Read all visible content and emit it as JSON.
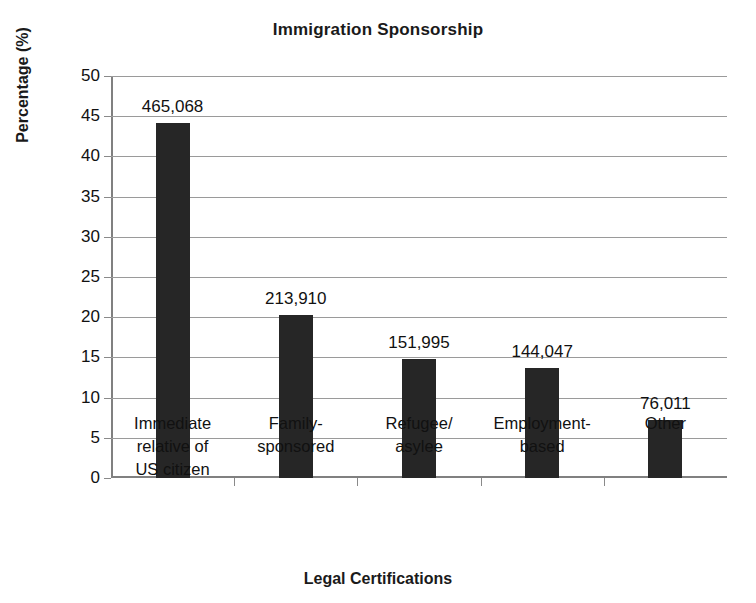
{
  "chart_data": {
    "type": "bar",
    "title": "Immigration Sponsorship",
    "xlabel": "Legal Certifications",
    "ylabel": "Percentage (%)",
    "ylim": [
      0,
      50
    ],
    "ytick_step": 5,
    "yticks": [
      "50",
      "45",
      "40",
      "35",
      "30",
      "25",
      "20",
      "15",
      "10",
      "5",
      "0"
    ],
    "grid": true,
    "legend": "none",
    "bar_color": "#262626",
    "categories": [
      "Immediate relative of US citizen",
      "Family-sponsored",
      "Refugee/ asylee",
      "Employment- based",
      "Other"
    ],
    "category_lines": [
      [
        "Immediate",
        "relative of",
        "US citizen"
      ],
      [
        "Family-",
        "sponsored"
      ],
      [
        "Refugee/",
        "asylee"
      ],
      [
        "Employment-",
        "based"
      ],
      [
        "Other"
      ]
    ],
    "values": [
      44.2,
      20.3,
      14.8,
      13.7,
      7.2
    ],
    "data_labels": [
      "465,068",
      "213,910",
      "151,995",
      "144,047",
      "76,011"
    ],
    "counts": [
      465068,
      213910,
      151995,
      144047,
      76011
    ]
  }
}
